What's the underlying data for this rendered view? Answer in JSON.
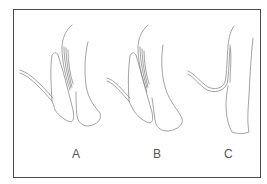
{
  "figure": {
    "panels": [
      {
        "label": "A",
        "x": 72
      },
      {
        "label": "B",
        "x": 153
      },
      {
        "label": "C",
        "x": 224
      }
    ],
    "colors": {
      "border": "#4a4a4a",
      "line": "#8a8a8a",
      "label": "#555555",
      "background": "#ffffff"
    }
  }
}
